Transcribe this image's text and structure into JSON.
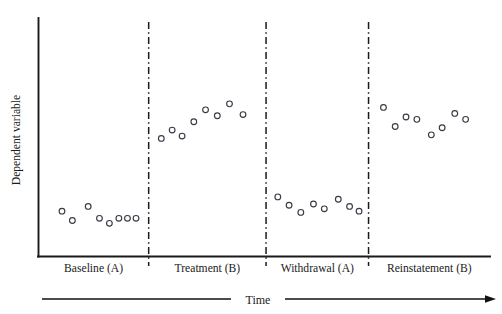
{
  "chart_data": {
    "type": "scatter",
    "title": "",
    "xlabel": "Time",
    "ylabel": "Dependent variable",
    "grid": false,
    "legend": "none",
    "axis_style": "open-left-bottom",
    "marker": "open-circle",
    "xlim": [
      0,
      100
    ],
    "ylim": [
      0,
      100
    ],
    "axis_ticks": "none",
    "phase_dividers_x": [
      24.4,
      50.4,
      73.1
    ],
    "phases": [
      {
        "label": "Baseline (A)",
        "condition": "A",
        "points": [
          {
            "x": 5.2,
            "y": 19.0
          },
          {
            "x": 7.5,
            "y": 15.1
          },
          {
            "x": 11.0,
            "y": 21.0
          },
          {
            "x": 13.5,
            "y": 16.0
          },
          {
            "x": 15.7,
            "y": 13.9
          },
          {
            "x": 17.8,
            "y": 16.0
          },
          {
            "x": 19.7,
            "y": 16.0
          },
          {
            "x": 21.6,
            "y": 16.0
          }
        ]
      },
      {
        "label": "Treatment (B)",
        "condition": "B",
        "points": [
          {
            "x": 27.2,
            "y": 49.5
          },
          {
            "x": 29.6,
            "y": 53.0
          },
          {
            "x": 31.8,
            "y": 50.5
          },
          {
            "x": 34.4,
            "y": 56.5
          },
          {
            "x": 37.0,
            "y": 61.5
          },
          {
            "x": 39.6,
            "y": 59.0
          },
          {
            "x": 42.3,
            "y": 64.0
          },
          {
            "x": 45.3,
            "y": 59.5
          }
        ]
      },
      {
        "label": "Withdrawal (A)",
        "condition": "A",
        "points": [
          {
            "x": 53.0,
            "y": 25.0
          },
          {
            "x": 55.5,
            "y": 21.5
          },
          {
            "x": 58.1,
            "y": 18.5
          },
          {
            "x": 60.9,
            "y": 22.0
          },
          {
            "x": 63.3,
            "y": 20.0
          },
          {
            "x": 66.4,
            "y": 24.0
          },
          {
            "x": 68.9,
            "y": 21.0
          },
          {
            "x": 71.0,
            "y": 19.0
          }
        ]
      },
      {
        "label": "Reinstatement (B)",
        "condition": "B",
        "points": [
          {
            "x": 76.4,
            "y": 62.5
          },
          {
            "x": 79.0,
            "y": 54.5
          },
          {
            "x": 81.4,
            "y": 58.5
          },
          {
            "x": 83.8,
            "y": 57.5
          },
          {
            "x": 87.0,
            "y": 51.0
          },
          {
            "x": 89.4,
            "y": 54.0
          },
          {
            "x": 92.2,
            "y": 60.0
          },
          {
            "x": 94.6,
            "y": 57.5
          }
        ]
      }
    ]
  },
  "axes": {
    "y_title": "Dependent variable",
    "x_timeline_label": "Time"
  },
  "phase_labels": [
    "Baseline (A)",
    "Treatment (B)",
    "Withdrawal (A)",
    "Reinstatement (B)"
  ],
  "colors": {
    "axis": "#1a1a1a",
    "marker_stroke": "#3a3a46",
    "marker_fill": "#ffffff",
    "background": "#ffffff",
    "text": "#1a1a1a"
  }
}
